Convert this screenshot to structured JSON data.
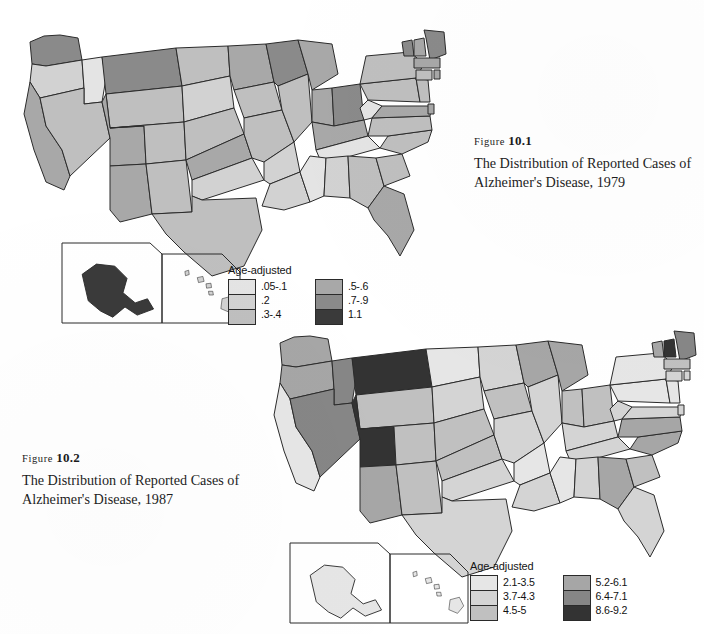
{
  "figures": [
    {
      "id": "figure-10-1",
      "label_prefix": "Figure",
      "label_number": "10.1",
      "caption_line1": "The Distribution of Reported Cases of",
      "caption_line2": "Alzheimer's Disease, 1979",
      "year": "1979",
      "legend": {
        "title": "Age-adjusted",
        "left_items": [
          {
            "label": ".05-.1",
            "color": "#e4e4e4"
          },
          {
            "label": ".2",
            "color": "#d2d2d2"
          },
          {
            "label": ".3-.4",
            "color": "#bfbfbf"
          }
        ],
        "right_items": [
          {
            "label": ".5-.6",
            "color": "#a8a8a8"
          },
          {
            "label": ".7-.9",
            "color": "#8a8a8a"
          },
          {
            "label": "1.1",
            "color": "#3a3a3a"
          }
        ]
      }
    },
    {
      "id": "figure-10-2",
      "label_prefix": "Figure",
      "label_number": "10.2",
      "caption_line1": "The Distribution of Reported Cases of",
      "caption_line2": "Alzheimer's Disease, 1987",
      "year": "1987",
      "legend": {
        "title": "Age-adjusted",
        "left_items": [
          {
            "label": "2.1-3.5",
            "color": "#e6e6e6"
          },
          {
            "label": "3.7-4.3",
            "color": "#d4d4d4"
          },
          {
            "label": "4.5-5",
            "color": "#c0c0c0"
          }
        ],
        "right_items": [
          {
            "label": "5.2-6.1",
            "color": "#a6a6a6"
          },
          {
            "label": "6.4-7.1",
            "color": "#868686"
          },
          {
            "label": "8.6-9.2",
            "color": "#333333"
          }
        ]
      }
    }
  ],
  "chart_data": [
    {
      "type": "heatmap",
      "subtype": "choropleth-map",
      "title": "The Distribution of Reported Cases of Alzheimer's Disease, 1979",
      "figure": "Figure 10.1",
      "region": "United States (50 states)",
      "value_label": "Age-adjusted rate",
      "legend_position": "bottom-center",
      "bins": [
        {
          "label": ".05-.1",
          "color": "#e4e4e4"
        },
        {
          "label": ".2",
          "color": "#d2d2d2"
        },
        {
          "label": ".3-.4",
          "color": "#bfbfbf"
        },
        {
          "label": ".5-.6",
          "color": "#a8a8a8"
        },
        {
          "label": ".7-.9",
          "color": "#8a8a8a"
        },
        {
          "label": "1.1",
          "color": "#3a3a3a"
        }
      ],
      "states": [
        {
          "code": "WA",
          "name": "Washington",
          "bin": ".7-.9"
        },
        {
          "code": "OR",
          "name": "Oregon",
          "bin": ".2"
        },
        {
          "code": "CA",
          "name": "California",
          "bin": ".5-.6"
        },
        {
          "code": "ID",
          "name": "Idaho",
          "bin": ".05-.1"
        },
        {
          "code": "NV",
          "name": "Nevada",
          "bin": ".3-.4"
        },
        {
          "code": "MT",
          "name": "Montana",
          "bin": ".7-.9"
        },
        {
          "code": "WY",
          "name": "Wyoming",
          "bin": ".3-.4"
        },
        {
          "code": "UT",
          "name": "Utah",
          "bin": ".5-.6"
        },
        {
          "code": "AZ",
          "name": "Arizona",
          "bin": ".5-.6"
        },
        {
          "code": "CO",
          "name": "Colorado",
          "bin": ".3-.4"
        },
        {
          "code": "NM",
          "name": "New Mexico",
          "bin": ".3-.4"
        },
        {
          "code": "ND",
          "name": "North Dakota",
          "bin": ".3-.4"
        },
        {
          "code": "SD",
          "name": "South Dakota",
          "bin": ".2"
        },
        {
          "code": "NE",
          "name": "Nebraska",
          "bin": ".3-.4"
        },
        {
          "code": "KS",
          "name": "Kansas",
          "bin": ".5-.6"
        },
        {
          "code": "OK",
          "name": "Oklahoma",
          "bin": ".2"
        },
        {
          "code": "TX",
          "name": "Texas",
          "bin": ".3-.4"
        },
        {
          "code": "MN",
          "name": "Minnesota",
          "bin": ".5-.6"
        },
        {
          "code": "IA",
          "name": "Iowa",
          "bin": ".3-.4"
        },
        {
          "code": "MO",
          "name": "Missouri",
          "bin": ".3-.4"
        },
        {
          "code": "AR",
          "name": "Arkansas",
          "bin": ".2"
        },
        {
          "code": "LA",
          "name": "Louisiana",
          "bin": ".2"
        },
        {
          "code": "WI",
          "name": "Wisconsin",
          "bin": ".7-.9"
        },
        {
          "code": "IL",
          "name": "Illinois",
          "bin": ".3-.4"
        },
        {
          "code": "MI",
          "name": "Michigan",
          "bin": ".5-.6"
        },
        {
          "code": "IN",
          "name": "Indiana",
          "bin": ".5-.6"
        },
        {
          "code": "OH",
          "name": "Ohio",
          "bin": ".7-.9"
        },
        {
          "code": "KY",
          "name": "Kentucky",
          "bin": ".5-.6"
        },
        {
          "code": "TN",
          "name": "Tennessee",
          "bin": ".05-.1"
        },
        {
          "code": "MS",
          "name": "Mississippi",
          "bin": ".05-.1"
        },
        {
          "code": "AL",
          "name": "Alabama",
          "bin": ".2"
        },
        {
          "code": "GA",
          "name": "Georgia",
          "bin": ".3-.4"
        },
        {
          "code": "FL",
          "name": "Florida",
          "bin": ".5-.6"
        },
        {
          "code": "SC",
          "name": "South Carolina",
          "bin": ".3-.4"
        },
        {
          "code": "NC",
          "name": "North Carolina",
          "bin": ".3-.4"
        },
        {
          "code": "VA",
          "name": "Virginia",
          "bin": ".3-.4"
        },
        {
          "code": "WV",
          "name": "West Virginia",
          "bin": ".05-.1"
        },
        {
          "code": "MD",
          "name": "Maryland",
          "bin": ".5-.6"
        },
        {
          "code": "DE",
          "name": "Delaware",
          "bin": ".5-.6"
        },
        {
          "code": "PA",
          "name": "Pennsylvania",
          "bin": ".3-.4"
        },
        {
          "code": "NJ",
          "name": "New Jersey",
          "bin": ".3-.4"
        },
        {
          "code": "NY",
          "name": "New York",
          "bin": ".3-.4"
        },
        {
          "code": "CT",
          "name": "Connecticut",
          "bin": ".3-.4"
        },
        {
          "code": "RI",
          "name": "Rhode Island",
          "bin": ".5-.6"
        },
        {
          "code": "MA",
          "name": "Massachusetts",
          "bin": ".5-.6"
        },
        {
          "code": "VT",
          "name": "Vermont",
          "bin": ".7-.9"
        },
        {
          "code": "NH",
          "name": "New Hampshire",
          "bin": ".5-.6"
        },
        {
          "code": "ME",
          "name": "Maine",
          "bin": ".7-.9"
        },
        {
          "code": "AK",
          "name": "Alaska",
          "bin": "1.1"
        },
        {
          "code": "HI",
          "name": "Hawaii",
          "bin": ".2"
        }
      ]
    },
    {
      "type": "heatmap",
      "subtype": "choropleth-map",
      "title": "The Distribution of Reported Cases of Alzheimer's Disease, 1987",
      "figure": "Figure 10.2",
      "region": "United States (50 states)",
      "value_label": "Age-adjusted rate",
      "legend_position": "bottom-center",
      "bins": [
        {
          "label": "2.1-3.5",
          "color": "#e6e6e6"
        },
        {
          "label": "3.7-4.3",
          "color": "#d4d4d4"
        },
        {
          "label": "4.5-5",
          "color": "#c0c0c0"
        },
        {
          "label": "5.2-6.1",
          "color": "#a6a6a6"
        },
        {
          "label": "6.4-7.1",
          "color": "#868686"
        },
        {
          "label": "8.6-9.2",
          "color": "#333333"
        }
      ],
      "states": [
        {
          "code": "WA",
          "name": "Washington",
          "bin": "5.2-6.1"
        },
        {
          "code": "OR",
          "name": "Oregon",
          "bin": "5.2-6.1"
        },
        {
          "code": "CA",
          "name": "California",
          "bin": "2.1-3.5"
        },
        {
          "code": "ID",
          "name": "Idaho",
          "bin": "6.4-7.1"
        },
        {
          "code": "NV",
          "name": "Nevada",
          "bin": "6.4-7.1"
        },
        {
          "code": "MT",
          "name": "Montana",
          "bin": "8.6-9.2"
        },
        {
          "code": "WY",
          "name": "Wyoming",
          "bin": "4.5-5"
        },
        {
          "code": "UT",
          "name": "Utah",
          "bin": "8.6-9.2"
        },
        {
          "code": "AZ",
          "name": "Arizona",
          "bin": "5.2-6.1"
        },
        {
          "code": "CO",
          "name": "Colorado",
          "bin": "4.5-5"
        },
        {
          "code": "NM",
          "name": "New Mexico",
          "bin": "4.5-5"
        },
        {
          "code": "ND",
          "name": "North Dakota",
          "bin": "2.1-3.5"
        },
        {
          "code": "SD",
          "name": "South Dakota",
          "bin": "3.7-4.3"
        },
        {
          "code": "NE",
          "name": "Nebraska",
          "bin": "4.5-5"
        },
        {
          "code": "KS",
          "name": "Kansas",
          "bin": "4.5-5"
        },
        {
          "code": "OK",
          "name": "Oklahoma",
          "bin": "3.7-4.3"
        },
        {
          "code": "TX",
          "name": "Texas",
          "bin": "3.7-4.3"
        },
        {
          "code": "MN",
          "name": "Minnesota",
          "bin": "3.7-4.3"
        },
        {
          "code": "IA",
          "name": "Iowa",
          "bin": "4.5-5"
        },
        {
          "code": "MO",
          "name": "Missouri",
          "bin": "3.7-4.3"
        },
        {
          "code": "AR",
          "name": "Arkansas",
          "bin": "2.1-3.5"
        },
        {
          "code": "LA",
          "name": "Louisiana",
          "bin": "3.7-4.3"
        },
        {
          "code": "WI",
          "name": "Wisconsin",
          "bin": "5.2-6.1"
        },
        {
          "code": "IL",
          "name": "Illinois",
          "bin": "3.7-4.3"
        },
        {
          "code": "MI",
          "name": "Michigan",
          "bin": "5.2-6.1"
        },
        {
          "code": "IN",
          "name": "Indiana",
          "bin": "4.5-5"
        },
        {
          "code": "OH",
          "name": "Ohio",
          "bin": "4.5-5"
        },
        {
          "code": "KY",
          "name": "Kentucky",
          "bin": "3.7-4.3"
        },
        {
          "code": "TN",
          "name": "Tennessee",
          "bin": "3.7-4.3"
        },
        {
          "code": "MS",
          "name": "Mississippi",
          "bin": "2.1-3.5"
        },
        {
          "code": "AL",
          "name": "Alabama",
          "bin": "3.7-4.3"
        },
        {
          "code": "GA",
          "name": "Georgia",
          "bin": "5.2-6.1"
        },
        {
          "code": "FL",
          "name": "Florida",
          "bin": "3.7-4.3"
        },
        {
          "code": "SC",
          "name": "South Carolina",
          "bin": "4.5-5"
        },
        {
          "code": "NC",
          "name": "North Carolina",
          "bin": "5.2-6.1"
        },
        {
          "code": "VA",
          "name": "Virginia",
          "bin": "5.2-6.1"
        },
        {
          "code": "WV",
          "name": "West Virginia",
          "bin": "3.7-4.3"
        },
        {
          "code": "MD",
          "name": "Maryland",
          "bin": "3.7-4.3"
        },
        {
          "code": "DE",
          "name": "Delaware",
          "bin": "3.7-4.3"
        },
        {
          "code": "PA",
          "name": "Pennsylvania",
          "bin": "2.1-3.5"
        },
        {
          "code": "NJ",
          "name": "New Jersey",
          "bin": "2.1-3.5"
        },
        {
          "code": "NY",
          "name": "New York",
          "bin": "2.1-3.5"
        },
        {
          "code": "CT",
          "name": "Connecticut",
          "bin": "3.7-4.3"
        },
        {
          "code": "RI",
          "name": "Rhode Island",
          "bin": "3.7-4.3"
        },
        {
          "code": "MA",
          "name": "Massachusetts",
          "bin": "4.5-5"
        },
        {
          "code": "VT",
          "name": "Vermont",
          "bin": "5.2-6.1"
        },
        {
          "code": "NH",
          "name": "New Hampshire",
          "bin": "8.6-9.2"
        },
        {
          "code": "ME",
          "name": "Maine",
          "bin": "6.4-7.1"
        },
        {
          "code": "AK",
          "name": "Alaska",
          "bin": "2.1-3.5"
        },
        {
          "code": "HI",
          "name": "Hawaii",
          "bin": "2.1-3.5"
        }
      ]
    }
  ]
}
